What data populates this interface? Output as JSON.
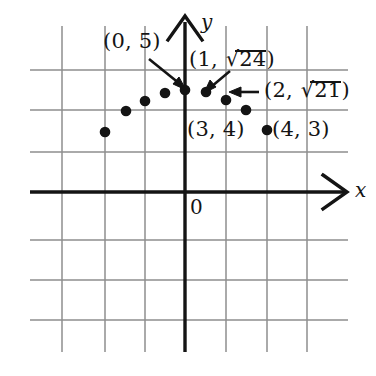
{
  "figure": {
    "title_visible": false,
    "axis_labels": {
      "x": "x",
      "y": "y"
    },
    "origin_label": "0",
    "colors": {
      "ink": "#141414",
      "grid": "#8a8a8a",
      "grid_faint": "#b4b4b4",
      "background": "#ffffff"
    }
  },
  "annotations": {
    "p0": {
      "text_prefix": "(0, 5)",
      "full": "(0, 5)"
    },
    "p1": {
      "open": "(1, ",
      "radical": "24",
      "close": ")",
      "full": "(1, √24)"
    },
    "p2": {
      "open": "(2, ",
      "radical": "21",
      "close": ")",
      "full": "(2, √21)"
    },
    "p3": {
      "full": "(3, 4)"
    },
    "p4": {
      "full": "(4, 3)"
    }
  },
  "chart_data": {
    "type": "scatter",
    "title": "",
    "xlabel": "x",
    "ylabel": "y",
    "grid": true,
    "legend": "none",
    "xlim": [
      -5,
      5
    ],
    "ylim": [
      -3,
      6
    ],
    "x_tick_spacing": 1,
    "y_tick_spacing": 1,
    "points": [
      {
        "x": -4,
        "y": 3,
        "y_label": "3",
        "px": 105,
        "py": 132
      },
      {
        "x": -3,
        "y": 4,
        "y_label": "4",
        "px": 126,
        "py": 111
      },
      {
        "x": -2,
        "y": 4.5825757,
        "y_label": "√21",
        "px": 145,
        "py": 101
      },
      {
        "x": -1,
        "y": 4.8989795,
        "y_label": "√24",
        "px": 165,
        "py": 93
      },
      {
        "x": 0,
        "y": 5,
        "y_label": "5",
        "px": 185,
        "py": 90
      },
      {
        "x": 1,
        "y": 4.8989795,
        "y_label": "√24",
        "px": 206,
        "py": 92
      },
      {
        "x": 2,
        "y": 4.5825757,
        "y_label": "√21",
        "px": 226,
        "py": 100
      },
      {
        "x": 3,
        "y": 4,
        "y_label": "4",
        "px": 246,
        "py": 110
      },
      {
        "x": 4,
        "y": 3,
        "y_label": "3",
        "px": 267,
        "py": 130
      }
    ],
    "labeled_points": [
      {
        "label": "(0, 5)",
        "x": 0,
        "y": 5
      },
      {
        "label": "(1, √24)",
        "x": 1,
        "y": 4.8989795
      },
      {
        "label": "(2, √21)",
        "x": 2,
        "y": 4.5825757
      },
      {
        "label": "(3, 4)",
        "x": 3,
        "y": 4
      },
      {
        "label": "(4, 3)",
        "x": 4,
        "y": 3
      }
    ],
    "gridlines": {
      "vertical_px": [
        62,
        105,
        145,
        185,
        226,
        267,
        307
      ],
      "horizontal_px": [
        70,
        110,
        152,
        192,
        240,
        280,
        320
      ]
    },
    "axes_px": {
      "x_axis_y": 192,
      "y_axis_x": 185
    }
  }
}
